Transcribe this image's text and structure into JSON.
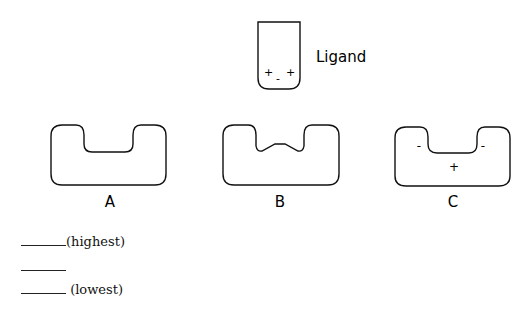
{
  "ligand": {
    "label": "Ligand",
    "charges": [
      "+",
      "-",
      "+"
    ]
  },
  "receptors": [
    {
      "id": "A",
      "label": "A",
      "pocket": "flat",
      "charges": []
    },
    {
      "id": "B",
      "label": "B",
      "pocket": "bumped",
      "charges": []
    },
    {
      "id": "C",
      "label": "C",
      "pocket": "flat",
      "charges": [
        "-",
        "-",
        "+"
      ]
    }
  ],
  "ranking": {
    "lines": [
      {
        "blank": "",
        "suffix": "(highest)"
      },
      {
        "blank": "",
        "suffix": ""
      },
      {
        "blank": "",
        "suffix": " (lowest)"
      }
    ]
  },
  "colors": {
    "stroke": "#111111",
    "background": "#ffffff"
  }
}
